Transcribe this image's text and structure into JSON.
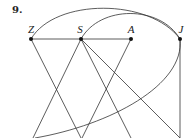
{
  "problem_number": "9.",
  "diagram": {
    "type": "graph",
    "vertices": [
      {
        "id": "Z",
        "label": "Z",
        "x": 31,
        "y": 39
      },
      {
        "id": "S",
        "label": "S",
        "x": 81,
        "y": 39
      },
      {
        "id": "A",
        "label": "A",
        "x": 131,
        "y": 39
      },
      {
        "id": "J",
        "label": "J",
        "x": 180,
        "y": 39
      }
    ],
    "edges": [
      {
        "from": "Z",
        "to": "A",
        "kind": "line"
      },
      {
        "from": "Z",
        "to": "bottom",
        "kind": "line"
      },
      {
        "from": "S",
        "to": "bottom",
        "kind": "line"
      },
      {
        "from": "A",
        "to": "bottom",
        "kind": "line"
      },
      {
        "from": "J",
        "to": "bottom",
        "kind": "line"
      },
      {
        "from": "Z",
        "to": "J",
        "kind": "arc"
      },
      {
        "from": "S",
        "to": "J",
        "kind": "arc"
      },
      {
        "from": "J",
        "to": "bottom-left",
        "kind": "curve"
      }
    ],
    "line_color": "#333333"
  }
}
